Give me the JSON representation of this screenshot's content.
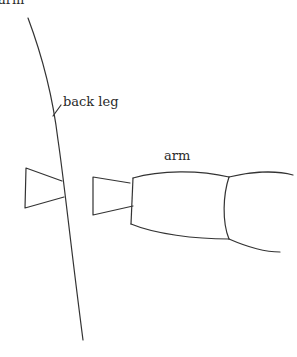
{
  "diagram": {
    "labels": {
      "top_cropped": "arm",
      "back_leg": "back leg",
      "arm": "arm"
    },
    "colors": {
      "line": "#333333",
      "text": "#2a2a2a",
      "background": "#ffffff"
    }
  }
}
